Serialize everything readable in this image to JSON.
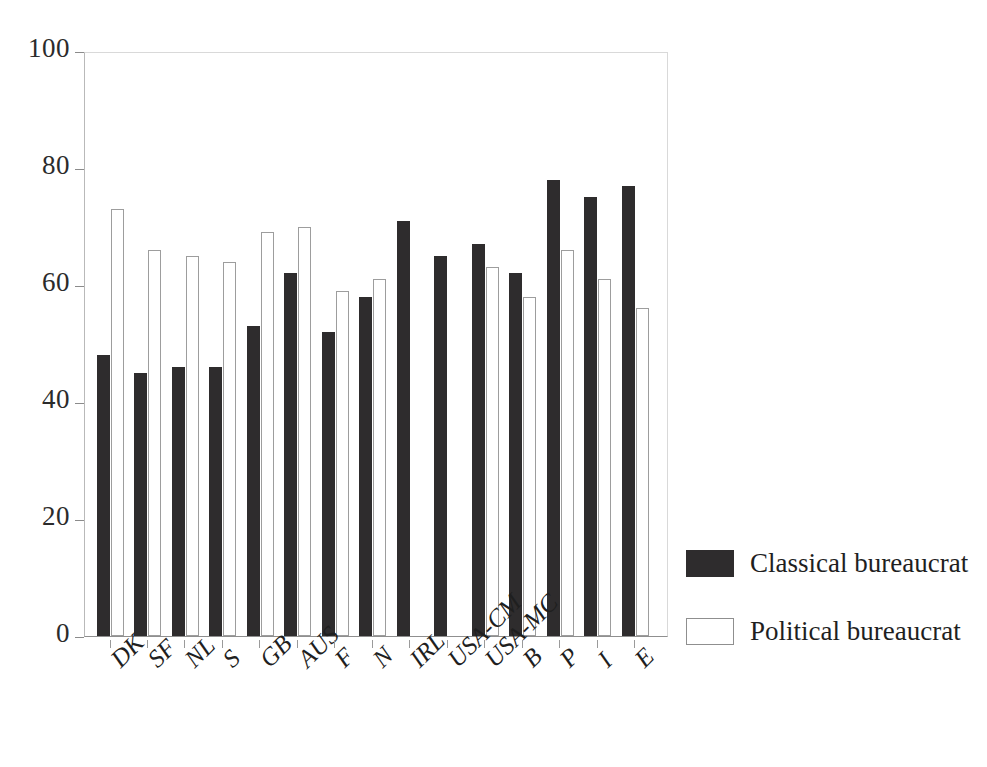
{
  "chart_data": {
    "type": "bar",
    "title": "",
    "subtitle": "",
    "xlabel": "",
    "ylabel": "",
    "ylim": [
      0,
      100
    ],
    "yticks": [
      0,
      20,
      40,
      60,
      80,
      100
    ],
    "ytick_labels": [
      "0",
      "20",
      "40",
      "60",
      "80",
      "100"
    ],
    "grid": false,
    "legend_position": "right",
    "categories": [
      "DK",
      "SF",
      "NL",
      "S",
      "GB",
      "AUS",
      "F",
      "N",
      "IRL",
      "USA-CM",
      "USA-MC",
      "B",
      "P",
      "I",
      "E"
    ],
    "series": [
      {
        "name": "Classical bureaucrat",
        "color": "#2e2c2d",
        "values": [
          48,
          45,
          46,
          46,
          53,
          62,
          52,
          58,
          71,
          65,
          67,
          62,
          78,
          75,
          77
        ]
      },
      {
        "name": "Political bureaucrat",
        "color": "#ffffff",
        "values": [
          73,
          66,
          65,
          64,
          69,
          70,
          59,
          61,
          null,
          null,
          63,
          58,
          66,
          61,
          56
        ]
      }
    ]
  },
  "legend": {
    "items": [
      {
        "label": "Classical bureaucrat",
        "swatch": "classical"
      },
      {
        "label": "Political bureaucrat",
        "swatch": "political"
      }
    ]
  },
  "colors": {
    "classical": "#2e2c2d",
    "political": "#ffffff",
    "axis": "#8f8f8f",
    "background": "#ffffff"
  }
}
